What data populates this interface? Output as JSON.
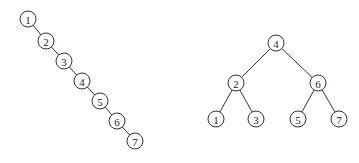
{
  "diagram": {
    "node_radius": 8,
    "trees": [
      {
        "name": "degenerate-tree",
        "nodes": [
          {
            "id": "L1",
            "label": "1",
            "x": 28,
            "y": 19
          },
          {
            "id": "L2",
            "label": "2",
            "x": 46,
            "y": 41
          },
          {
            "id": "L3",
            "label": "3",
            "x": 64,
            "y": 61
          },
          {
            "id": "L4",
            "label": "4",
            "x": 82,
            "y": 81
          },
          {
            "id": "L5",
            "label": "5",
            "x": 100,
            "y": 101
          },
          {
            "id": "L6",
            "label": "6",
            "x": 117,
            "y": 121
          },
          {
            "id": "L7",
            "label": "7",
            "x": 135,
            "y": 141
          }
        ],
        "edges": [
          [
            "L1",
            "L2"
          ],
          [
            "L2",
            "L3"
          ],
          [
            "L3",
            "L4"
          ],
          [
            "L4",
            "L5"
          ],
          [
            "L5",
            "L6"
          ],
          [
            "L6",
            "L7"
          ]
        ]
      },
      {
        "name": "balanced-tree",
        "nodes": [
          {
            "id": "R4",
            "label": "4",
            "x": 276,
            "y": 43
          },
          {
            "id": "R2",
            "label": "2",
            "x": 236,
            "y": 83
          },
          {
            "id": "R6",
            "label": "6",
            "x": 318,
            "y": 83
          },
          {
            "id": "R1",
            "label": "1",
            "x": 216,
            "y": 119
          },
          {
            "id": "R3",
            "label": "3",
            "x": 256,
            "y": 119
          },
          {
            "id": "R5",
            "label": "5",
            "x": 298,
            "y": 119
          },
          {
            "id": "R7",
            "label": "7",
            "x": 339,
            "y": 119
          }
        ],
        "edges": [
          [
            "R4",
            "R2"
          ],
          [
            "R4",
            "R6"
          ],
          [
            "R2",
            "R1"
          ],
          [
            "R2",
            "R3"
          ],
          [
            "R6",
            "R5"
          ],
          [
            "R6",
            "R7"
          ]
        ]
      }
    ]
  }
}
